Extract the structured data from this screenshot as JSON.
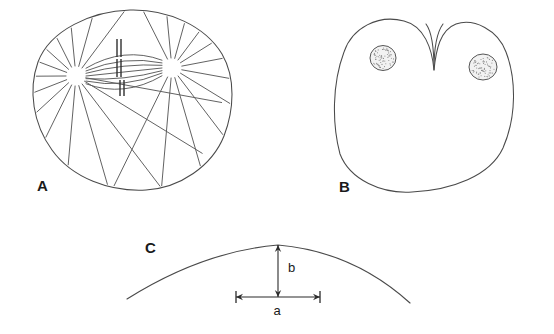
{
  "figure": {
    "background_color": "#ffffff",
    "line_color": "#4a4a4a",
    "label_color": "#1a1a1a",
    "panels": [
      {
        "id": "A",
        "label": "A",
        "label_x": 37,
        "label_y": 191,
        "name": "mitotic-spindle-cell"
      },
      {
        "id": "B",
        "label": "B",
        "label_x": 339,
        "label_y": 192,
        "name": "cleaving-cell"
      },
      {
        "id": "C",
        "label": "C",
        "label_x": 145,
        "label_y": 253,
        "name": "arc-geometry"
      }
    ]
  },
  "panel_a": {
    "cell_outline_path": "M 130 10 C 168 9 205 26 222 54 C 236 78 234 110 224 136 C 212 166 180 188 146 190 C 110 192 72 178 52 150 C 33 124 28 90 38 62 C 50 30 92 11 130 10 Z",
    "asters": [
      {
        "name": "aster-left",
        "cx": 76,
        "cy": 76,
        "inner_radius": 10,
        "ray_count": 17
      },
      {
        "name": "aster-right",
        "cx": 172,
        "cy": 68,
        "inner_radius": 10,
        "ray_count": 17
      }
    ],
    "chromosomes": [
      {
        "name": "chromosome-pair-1",
        "x": 119,
        "y": 48,
        "half_height": 9,
        "gap": 4
      },
      {
        "name": "chromosome-pair-2",
        "x": 119,
        "y": 68,
        "half_height": 9,
        "gap": 4
      },
      {
        "name": "chromosome-pair-3",
        "x": 122,
        "y": 88,
        "half_height": 8,
        "gap": 4
      }
    ]
  },
  "panel_b": {
    "cell_outline_path": "M 434 70 C 432 48 424 26 404 21 C 378 14 352 28 344 52 C 332 84 332 124 340 154 C 350 180 382 194 412 192 C 452 190 490 176 503 148 C 517 116 516 78 506 52 C 498 30 474 18 456 24 C 440 30 436 50 434 70 Z",
    "furrow": {
      "name": "cleavage-furrow",
      "path": "M 434 70 C 434 50 432 32 426 24 M 434 70 C 434 50 437 32 443 24"
    },
    "nuclei": [
      {
        "name": "nucleus-left",
        "cx": 383,
        "cy": 58,
        "rx": 13,
        "ry": 12.5
      },
      {
        "name": "nucleus-right",
        "cx": 483,
        "cy": 67,
        "rx": 14,
        "ry": 13
      }
    ]
  },
  "panel_c": {
    "arc_path": "M 127 299 C 170 272 220 250 278 245 C 336 250 378 274 410 303",
    "dimension_b": {
      "name": "sagitta-b",
      "label": "b",
      "x": 278,
      "y_top": 245,
      "y_bottom": 297,
      "label_x": 288,
      "label_y": 272
    },
    "dimension_a": {
      "name": "chord-a",
      "label": "a",
      "y": 297,
      "x_left": 236,
      "x_right": 320,
      "label_x": 277,
      "label_y": 315
    }
  }
}
